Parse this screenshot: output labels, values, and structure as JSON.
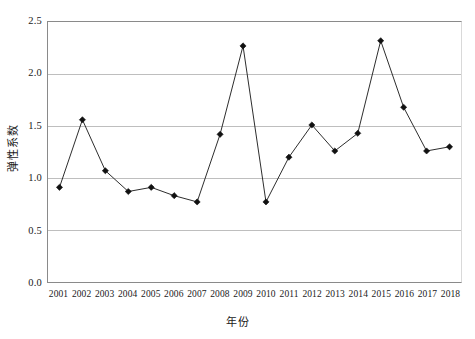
{
  "chart_data": {
    "type": "line",
    "title": "",
    "xlabel": "年份",
    "ylabel": "弹性系数",
    "categories": [
      "2001",
      "2002",
      "2003",
      "2004",
      "2005",
      "2006",
      "2007",
      "2008",
      "2009",
      "2010",
      "2011",
      "2012",
      "2013",
      "2014",
      "2015",
      "2016",
      "2017",
      "2018"
    ],
    "values": [
      0.91,
      1.56,
      1.07,
      0.87,
      0.91,
      0.83,
      0.77,
      1.42,
      2.27,
      0.77,
      1.2,
      1.51,
      1.26,
      1.43,
      2.32,
      1.68,
      1.26,
      1.3
    ],
    "series": [
      {
        "name": "弹性系数",
        "values": [
          0.91,
          1.56,
          1.07,
          0.87,
          0.91,
          0.83,
          0.77,
          1.42,
          2.27,
          0.77,
          1.2,
          1.51,
          1.26,
          1.43,
          2.32,
          1.68,
          1.26,
          1.3
        ]
      }
    ],
    "ylim": [
      0.0,
      2.5
    ],
    "yticks": [
      0.0,
      0.5,
      1.0,
      1.5,
      2.0,
      2.5
    ],
    "ytick_labels": [
      "0.0",
      "0.5",
      "1.0",
      "1.5",
      "2.0",
      "2.5"
    ],
    "xtick_labels": [
      "2001",
      "2002",
      "2003",
      "2004",
      "2005",
      "2006",
      "2007",
      "2008",
      "2009",
      "2010",
      "2011",
      "2012",
      "2013",
      "2014",
      "2015",
      "2016",
      "2017",
      "2018"
    ],
    "grid": "horizontal",
    "legend": "none",
    "marker": "diamond",
    "line_color": "#2b2b2b",
    "marker_color": "#111111",
    "grid_color": "#bdbdbd",
    "axis_color": "#8a8a8a",
    "background": "#ffffff"
  }
}
